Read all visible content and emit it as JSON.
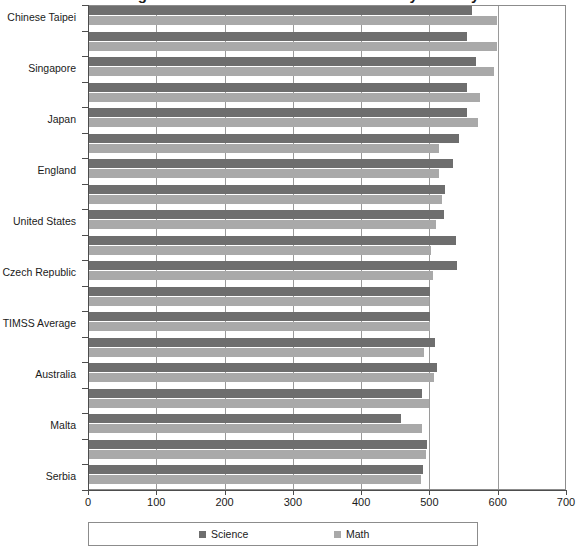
{
  "chart_data": {
    "type": "bar",
    "orientation": "horizontal",
    "title": "Average Science and Mathematics Scores by Country",
    "xlabel": "",
    "ylabel": "",
    "xlim": [
      0,
      700
    ],
    "xticks": [
      0,
      100,
      200,
      300,
      400,
      500,
      600,
      700
    ],
    "xtick_labels": [
      "0",
      "100",
      "200",
      "300",
      "400",
      "500",
      "600",
      "700"
    ],
    "grid": true,
    "legend_position": "bottom",
    "categories": [
      "Serbia",
      "Bulgaria",
      "Malta",
      "Norway",
      "Australia",
      "Sweden",
      "TIMSS Average",
      "Italy",
      "Czech Republic",
      "Slovenia",
      "United States",
      "Hungary",
      "England",
      "Russian Federation",
      "Japan",
      "Hong Kong SAR",
      "Singapore",
      "Korea, Rep. of",
      "Chinese Taipei"
    ],
    "series": [
      {
        "name": "Science",
        "color": "#6e6e6e",
        "values": [
          489,
          495,
          457,
          487,
          510,
          507,
          500,
          500,
          539,
          538,
          520,
          522,
          533,
          542,
          554,
          554,
          567,
          553,
          561
        ]
      },
      {
        "name": "Math",
        "color": "#a9a9a9",
        "values": [
          486,
          493,
          488,
          498,
          505,
          491,
          500,
          498,
          504,
          501,
          508,
          517,
          513,
          512,
          570,
          572,
          593,
          597,
          598
        ]
      }
    ]
  },
  "legend": {
    "items": [
      {
        "label": "Science",
        "color": "#6e6e6e"
      },
      {
        "label": "Math",
        "color": "#a9a9a9"
      }
    ]
  },
  "axis": {
    "visible_category_labels": [
      "Serbia",
      "Malta",
      "Australia",
      "TIMSS Average",
      "Czech Republic",
      "United States",
      "England",
      "Japan",
      "Singapore",
      "Chinese Taipei"
    ]
  }
}
